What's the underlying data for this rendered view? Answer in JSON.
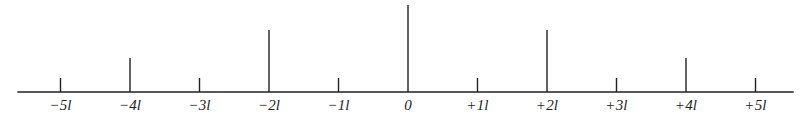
{
  "figure": {
    "name": "multiplet-stick-diagram",
    "line_color": "#231f20",
    "background_color": "#ffffff",
    "axis": {
      "x_start_px": 18,
      "x_end_px": 793,
      "baseline_y_px": 92,
      "stroke_width": 1.4
    },
    "label_y_px": 98,
    "tick_spacing_px": 69.5,
    "zero_x_px": 408
  },
  "chart_data": {
    "type": "bar",
    "title": "",
    "xlabel": "",
    "ylabel": "",
    "grid": false,
    "legend": null,
    "categories": [
      "-5l",
      "-4l",
      "-3l",
      "-2l",
      "-1l",
      "0",
      "+1l",
      "+2l",
      "+3l",
      "+4l",
      "+5l"
    ],
    "x": [
      -5,
      -4,
      -3,
      -2,
      -1,
      0,
      1,
      2,
      3,
      4,
      5
    ],
    "values": [
      14,
      34,
      14,
      62,
      14,
      87,
      14,
      62,
      14,
      34,
      14
    ],
    "tick_labels": [
      "−5l",
      "−4l",
      "−3l",
      "−2l",
      "−1l",
      "0",
      "+1l",
      "+2l",
      "+3l",
      "+4l",
      "+5l"
    ],
    "xlim": [
      -5.6,
      5.55
    ],
    "ylim": [
      0,
      92
    ],
    "annotations": []
  }
}
